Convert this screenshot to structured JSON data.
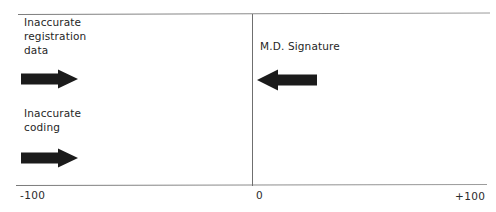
{
  "figure": {
    "type": "annotated-scale-diagram",
    "background_color": "#ffffff",
    "line_color": "#8a8a8a",
    "arrow_color": "#1b1b1b",
    "text_color": "#262626"
  },
  "axis": {
    "ticks": [
      {
        "label": "-100",
        "value": -100
      },
      {
        "label": "0",
        "value": 0
      },
      {
        "label": "+100",
        "value": 100
      }
    ],
    "divider_value": "0"
  },
  "left_region": {
    "annotations": [
      {
        "text": "Inaccurate\nregistration\ndata",
        "arrow_direction": "right",
        "arrow_name": "arrow-registration"
      },
      {
        "text": "Inaccurate\ncoding",
        "arrow_direction": "right",
        "arrow_name": "arrow-coding"
      }
    ]
  },
  "right_region": {
    "annotations": [
      {
        "text": "M.D. Signature",
        "arrow_direction": "left",
        "arrow_name": "arrow-signature"
      }
    ]
  }
}
